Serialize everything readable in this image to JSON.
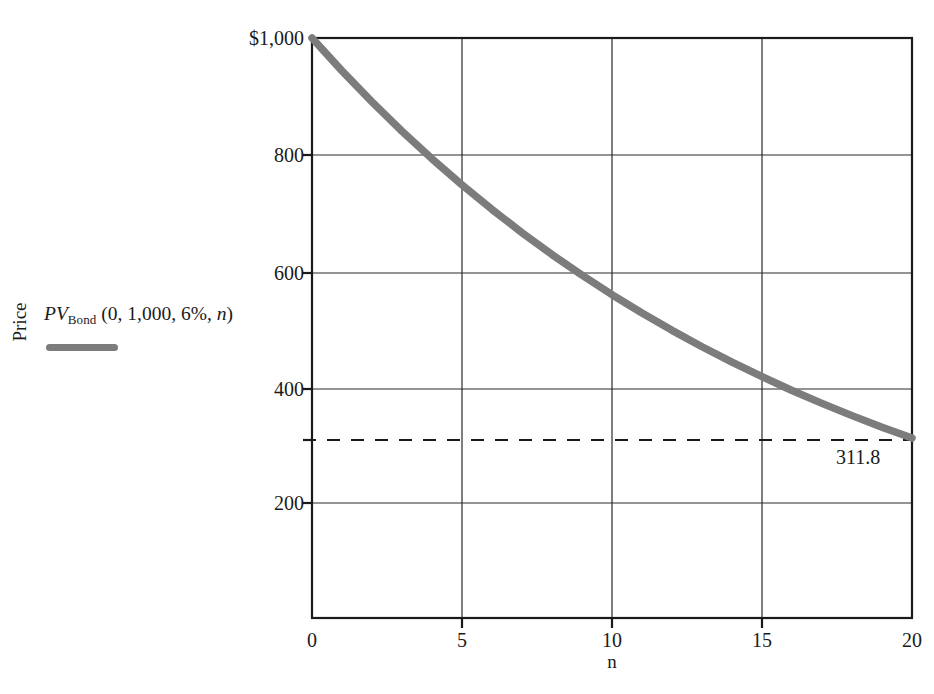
{
  "chart_data": {
    "type": "line",
    "title": "",
    "subtitle": "",
    "xlabel": "n",
    "ylabel": "Price",
    "xlim": [
      0,
      20
    ],
    "ylim": [
      0,
      1000
    ],
    "grid": true,
    "legend_position": "left-outside",
    "x_ticks": [
      "0",
      "5",
      "10",
      "15",
      "20"
    ],
    "x_tick_values": [
      0,
      5,
      10,
      15,
      20
    ],
    "y_ticks": [
      "200",
      "400",
      "600",
      "800",
      "$1,000"
    ],
    "y_tick_values": [
      200,
      400,
      600,
      800,
      1000
    ],
    "series": [
      {
        "name": "PV_Bond (0, 1,000, 6%, n)",
        "color": "#7c7c7c",
        "x": [
          0,
          1,
          2,
          3,
          4,
          5,
          6,
          7,
          8,
          9,
          10,
          11,
          12,
          13,
          14,
          15,
          16,
          17,
          18,
          19,
          20
        ],
        "values": [
          1000.0,
          943.4,
          890.0,
          839.6,
          792.1,
          747.3,
          705.0,
          665.1,
          627.4,
          591.9,
          558.4,
          526.8,
          497.0,
          468.8,
          442.3,
          417.3,
          393.6,
          371.4,
          350.3,
          330.5,
          311.8
        ]
      }
    ],
    "reference_line": {
      "type": "horizontal-dashed",
      "value": 311.8,
      "label": "311.8"
    },
    "annotations": [
      {
        "text": "311.8",
        "x": 20,
        "y": 311.8
      }
    ]
  },
  "legend": {
    "prefix_italic": "PV",
    "subscript": "Bond",
    "args": " (0, 1,000, 6%, ",
    "arg_italic": "n",
    "suffix": ")",
    "full_text": "PV_Bond (0, 1,000, 6%, n)",
    "swatch_color": "#7c7c7c"
  },
  "axes": {
    "y_title": "Price",
    "x_title": "n",
    "y_tick_labels": [
      "$1,000",
      "800",
      "600",
      "400",
      "200"
    ],
    "x_tick_labels": [
      "0",
      "5",
      "10",
      "15",
      "20"
    ]
  }
}
